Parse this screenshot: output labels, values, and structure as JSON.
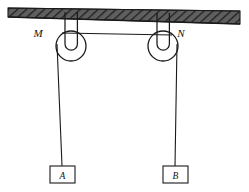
{
  "diagram": {
    "type": "physics-mechanics-pulley",
    "colors": {
      "stroke": "#1a1a1a",
      "ceiling_fill": "#595959",
      "ceiling_hatch": "#2b2b2b",
      "background": "#ffffff",
      "block_fill": "#ffffff"
    },
    "ceiling": {
      "name": "ceiling",
      "label": "",
      "hatched": true,
      "x_start": 8,
      "x_end": 240,
      "y_top_left": 8,
      "y_top_right": 11,
      "thickness_left": 9,
      "thickness_right": 13
    },
    "pulleys": [
      {
        "id": "M",
        "label": "M",
        "label_x": 38,
        "label_y": 37,
        "cx": 71,
        "cy": 46,
        "r_outer": 15,
        "r_inner": 7,
        "hook_top_y": 12,
        "hook_width": 13
      },
      {
        "id": "N",
        "label": "N",
        "label_x": 181,
        "label_y": 37,
        "cx": 163,
        "cy": 46,
        "r_outer": 15,
        "r_inner": 7,
        "hook_top_y": 13,
        "hook_width": 13
      }
    ],
    "ropes": [
      {
        "name": "rope-horizontal-between-pulleys",
        "x1": 71,
        "y1": 33,
        "x2": 163,
        "y2": 35
      },
      {
        "name": "rope-left-vertical-to-block-a",
        "x1": 57,
        "y1": 46,
        "x2": 62,
        "y2": 166
      },
      {
        "name": "rope-right-vertical-to-block-b",
        "x1": 177,
        "y1": 46,
        "x2": 175,
        "y2": 166
      }
    ],
    "blocks": [
      {
        "id": "A",
        "label": "A",
        "x": 50,
        "y": 166,
        "width": 25,
        "height": 17,
        "label_x": 62,
        "label_y": 178
      },
      {
        "id": "B",
        "label": "B",
        "x": 163,
        "y": 166,
        "width": 25,
        "height": 17,
        "label_x": 175,
        "label_y": 178
      }
    ]
  }
}
